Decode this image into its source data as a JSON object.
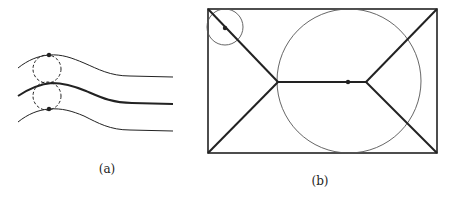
{
  "figure_a": {
    "label": "(a)",
    "description": "Three curved streamlines with two dashed circles between adjacent lines, dots on top and bottom lines"
  },
  "figure_b": {
    "label": "(b)",
    "description": "Rectangle with medial axis (skeleton), a small inscribed circle at top-left corner and a large maximal inscribed circle in center"
  },
  "colors": {
    "stroke": "#222222",
    "thin": "#444444"
  }
}
